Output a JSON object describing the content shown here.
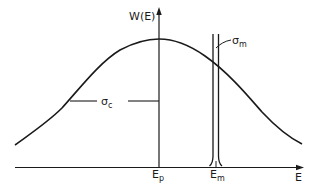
{
  "diagram": {
    "type": "energy-distribution",
    "colors": {
      "stroke": "#1a1a1a",
      "background": "#ffffff"
    },
    "axes": {
      "y_label": "W(E)",
      "x_label": "E"
    },
    "ticks": {
      "ep": {
        "main": "E",
        "sub": "p"
      },
      "em": {
        "main": "E",
        "sub": "m"
      }
    },
    "annotations": {
      "sigma_c": {
        "main": "σ",
        "sub": "c"
      },
      "sigma_m": {
        "main": "σ",
        "sub": "m"
      }
    }
  }
}
